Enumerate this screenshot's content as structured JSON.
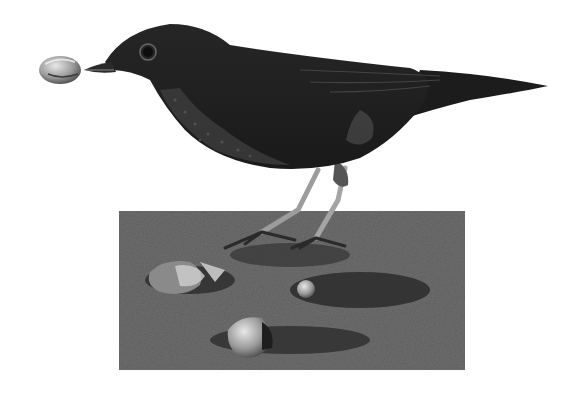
{
  "image": {
    "description": "Grayscale photo of a thrush holding a snail in its beak, standing on a patch of soil with broken snail shells",
    "subject": "thrush",
    "held_object": "snail",
    "ground_objects": [
      "broken snail shell",
      "snail shell",
      "broken snail shell"
    ],
    "colors": {
      "background": "#ffffff",
      "bird_dark": "#1a1a1a",
      "bird_mid": "#2e2e2e",
      "legs": "#9a9a9a",
      "ground": "#6b6b6b",
      "ground_dark": "#2a2a2a",
      "shell_light": "#c8c8c8"
    }
  }
}
